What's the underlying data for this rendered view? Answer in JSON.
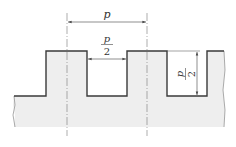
{
  "diagram": {
    "type": "rectangular-tooth-profile",
    "colors": {
      "fill": "#eeeeee",
      "outline": "#3a3a3a",
      "dim_line": "#444444",
      "center_line": "#777777"
    },
    "dimensions": {
      "pitch": {
        "label": "p"
      },
      "slot_width": {
        "numerator": "p",
        "denominator": "2"
      },
      "tooth_height": {
        "numerator": "p",
        "denominator": "2"
      }
    }
  }
}
